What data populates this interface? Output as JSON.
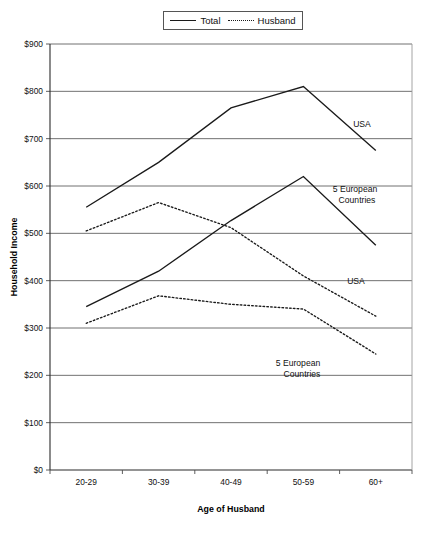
{
  "chart_data": {
    "type": "line",
    "title": "",
    "xlabel": "Age of Husband",
    "ylabel": "Household Income",
    "categories": [
      "20-29",
      "30-39",
      "40-49",
      "50-59",
      "60+"
    ],
    "ylim": [
      0,
      900
    ],
    "ytick_step": 100,
    "ytick_labels": [
      "$0",
      "$100",
      "$200",
      "$300",
      "$400",
      "$500",
      "$600",
      "$700",
      "$800",
      "$900"
    ],
    "grid": true,
    "legend_position": "top-center",
    "legend": [
      {
        "label": "Total",
        "style": "solid"
      },
      {
        "label": "Husband",
        "style": "dotted"
      }
    ],
    "series": [
      {
        "name": "Total",
        "region": "USA",
        "style": "solid",
        "values": [
          555,
          650,
          765,
          810,
          675
        ]
      },
      {
        "name": "Total",
        "region": "5 European Countries",
        "style": "solid",
        "values": [
          345,
          420,
          527,
          620,
          475
        ]
      },
      {
        "name": "Husband",
        "region": "USA",
        "style": "dotted",
        "values": [
          505,
          565,
          512,
          410,
          325
        ]
      },
      {
        "name": "Husband",
        "region": "5 European Countries",
        "style": "dotted",
        "values": [
          310,
          368,
          350,
          340,
          245
        ]
      }
    ],
    "annotations": [
      {
        "text": "USA",
        "series": "Total-USA",
        "x": 362,
        "y": 127
      },
      {
        "text": "5 European",
        "series": "Total-Europe",
        "x": 355,
        "y": 192
      },
      {
        "text": "Countries",
        "series": "Total-Europe",
        "x": 357,
        "y": 203
      },
      {
        "text": "USA",
        "series": "Husband-USA",
        "x": 356,
        "y": 284
      },
      {
        "text": "5 European",
        "series": "Husband-Europe",
        "x": 298,
        "y": 366
      },
      {
        "text": "Countries",
        "series": "Husband-Europe",
        "x": 302,
        "y": 377
      }
    ]
  },
  "colors": {
    "line": "#1a1a1a",
    "grid": "#4d4d4d",
    "background": "#ffffff"
  }
}
